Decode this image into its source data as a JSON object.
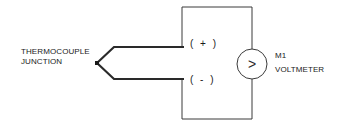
{
  "labels": {
    "junction_line1": "THERMOCOUPLE",
    "junction_line2": "JUNCTION",
    "meter_id": "M1",
    "meter_name": "VOLTMETER",
    "meter_symbol": ">",
    "positive_terminal": "( + )",
    "negative_terminal": "( - )"
  },
  "colors": {
    "line": "#3a3a3a",
    "wire": "#2a2a2a",
    "background": "#ffffff"
  },
  "components": [
    {
      "id": "thermocouple-junction",
      "type": "junction"
    },
    {
      "id": "M1",
      "type": "voltmeter"
    }
  ]
}
